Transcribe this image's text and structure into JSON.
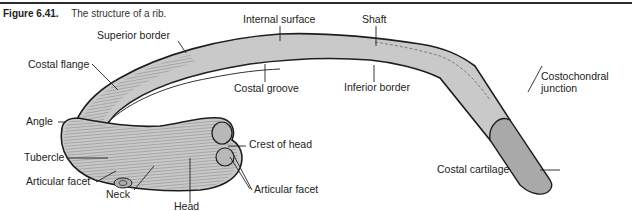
{
  "figure": {
    "number": "Figure 6.41.",
    "title": "The structure of a rib."
  },
  "labels": {
    "internal_surface": "Internal surface",
    "shaft": "Shaft",
    "superior_border": "Superior border",
    "costal_flange": "Costal flange",
    "costal_groove": "Costal groove",
    "inferior_border": "Inferior border",
    "costochondral_junction_1": "Costochondral",
    "costochondral_junction_2": "junction",
    "angle": "Angle",
    "crest_of_head": "Crest of head",
    "tubercle": "Tubercle",
    "articular_facet_tubercle": "Articular facet",
    "costal_cartilage": "Costal cartilage",
    "neck": "Neck",
    "articular_facet_head": "Articular facet",
    "head": "Head"
  },
  "colors": {
    "bone_fill": "#c9c9c9",
    "cartilage_fill": "#a9a9a9",
    "outline": "#1e1e1e"
  }
}
